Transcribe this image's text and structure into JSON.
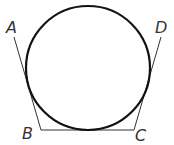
{
  "diagram": {
    "type": "geometry",
    "labels": {
      "A": "A",
      "B": "B",
      "C": "C",
      "D": "D"
    },
    "points": {
      "A": [
        14,
        37
      ],
      "B": [
        41,
        130
      ],
      "C": [
        134,
        130
      ],
      "D": [
        161,
        37
      ]
    },
    "circle": {
      "cx": 88,
      "cy": 68,
      "r": 62
    },
    "colors": {
      "circle": "#111111",
      "lines": "#333333",
      "labels": "#333333"
    }
  }
}
